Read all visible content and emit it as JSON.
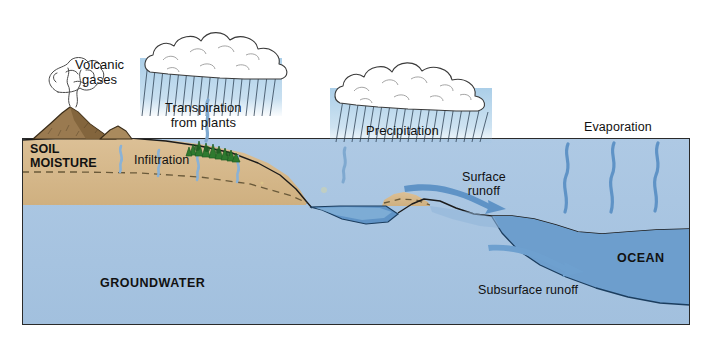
{
  "diagram": {
    "type": "schematic-cross-section"
  },
  "labels": {
    "volcanic_gases": "Volcanic\ngases",
    "transpiration": "Transpiration\nfrom plants",
    "precipitation": "Precipitation",
    "evaporation": "Evaporation",
    "infiltration": "Infiltration",
    "soil_moisture": "SOIL\nMOISTURE",
    "groundwater": "GROUNDWATER",
    "surface_runoff": "Surface\nrunoff",
    "subsurface_runoff": "Subsurface runoff",
    "ocean": "OCEAN"
  },
  "colors": {
    "soil": "#d8bb8d",
    "soil_shade": "#c9a874",
    "groundwater": "#a9c6e2",
    "ocean": "#6d9ecd",
    "river": "#5f93c6",
    "rain": "#9cc6e4",
    "rain_streak": "#2c3f52",
    "arrow": "#5f93c6",
    "vapor": "#5f93c6",
    "tree": "#2f7a2f",
    "tree_dark": "#1d5c22",
    "volcano": "#8a6a44",
    "volcano_dark": "#5d4527",
    "outline": "#1b1b1b",
    "cloud_outline": "#3a3a3a",
    "background": "#ffffff",
    "text": "#111111",
    "frame": "#2a2a2a"
  },
  "elements": {
    "clouds": [
      {
        "name": "cloud-left",
        "x": 205,
        "y": 62,
        "w": 132,
        "h": 50
      },
      {
        "name": "cloud-right",
        "x": 410,
        "y": 90,
        "w": 150,
        "h": 52
      }
    ],
    "rain_bands": [
      {
        "name": "rain-left",
        "x1": 145,
        "x2": 275,
        "y1": 62,
        "y2": 112
      },
      {
        "name": "rain-right",
        "x1": 335,
        "x2": 487,
        "y1": 93,
        "y2": 140
      }
    ],
    "evaporation_squiggles": [
      {
        "x": 566,
        "top": 143,
        "bottom": 213
      },
      {
        "x": 612,
        "top": 143,
        "bottom": 213
      },
      {
        "x": 656,
        "top": 143,
        "bottom": 213
      }
    ],
    "infiltration_drops": [
      {
        "x": 120,
        "top": 143,
        "bottom": 172
      },
      {
        "x": 158,
        "top": 146,
        "bottom": 176
      },
      {
        "x": 196,
        "top": 150,
        "bottom": 180
      },
      {
        "x": 236,
        "top": 150,
        "bottom": 182
      }
    ],
    "trees": {
      "x": 188,
      "y": 138,
      "w": 46,
      "h": 24,
      "count": 9
    },
    "volcano": {
      "x": 35,
      "base_y": 140,
      "peak_x": 72,
      "peak_y": 108
    },
    "frame": {
      "x": 22,
      "y": 138,
      "w": 668,
      "h": 187
    }
  },
  "label_positions": {
    "volcanic_gases": {
      "left": 75,
      "top": 58
    },
    "transpiration": {
      "left": 165,
      "top": 101
    },
    "precipitation": {
      "left": 366,
      "top": 124
    },
    "evaporation": {
      "left": 584,
      "top": 120
    },
    "infiltration": {
      "left": 134,
      "top": 153
    },
    "soil_moisture": {
      "left": 30,
      "top": 142
    },
    "groundwater": {
      "left": 100,
      "top": 276
    },
    "surface_runoff": {
      "left": 462,
      "top": 170
    },
    "subsurface_runoff": {
      "left": 478,
      "top": 283
    },
    "ocean": {
      "left": 617,
      "top": 251
    }
  }
}
